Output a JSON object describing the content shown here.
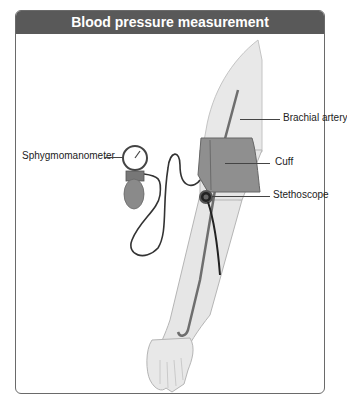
{
  "title": "Blood pressure measurement",
  "labels": {
    "brachial_artery": "Brachial artery",
    "cuff": "Cuff",
    "stethoscope": "Stethoscope",
    "sphygmomanometer": "Sphygmomanometer"
  },
  "colors": {
    "header_bg": "#595959",
    "skin": "#e6e6e6",
    "skin_outline": "#b5b5b5",
    "cuff": "#8f8f8f",
    "artery": "#6e6e6e",
    "tube": "#333333"
  }
}
